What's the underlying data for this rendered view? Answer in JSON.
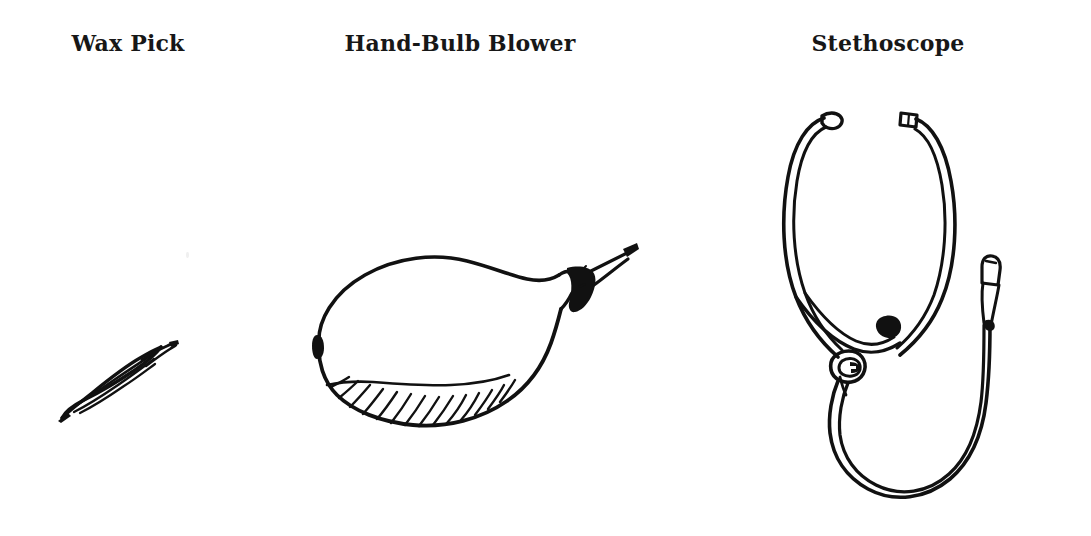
{
  "page": {
    "background_color": "#ffffff",
    "ink_color": "#111111",
    "width": 1091,
    "height": 536,
    "kind": "line-drawing-plate"
  },
  "figures": [
    {
      "id": "wax-pick",
      "caption": "Wax Pick",
      "icon_name": "wax-pick-drawing",
      "description": "slender spindle-shaped ear wax pick drawn on a diagonal"
    },
    {
      "id": "hand-bulb",
      "caption": "Hand-Bulb Blower",
      "icon_name": "hand-bulb-blower-drawing",
      "description": "teardrop rubber bulb with hatched underside and tapered nozzle"
    },
    {
      "id": "stethoscope",
      "caption": "Stethoscope",
      "icon_name": "stethoscope-drawing",
      "description": "binaural stethoscope with two earpieces, Y junction and looping tube"
    }
  ]
}
